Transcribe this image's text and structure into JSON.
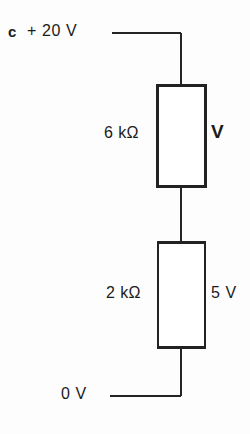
{
  "diagram": {
    "type": "electrical-circuit-schematic",
    "stroke_color": "#222222",
    "background_color": "#fdfdfd",
    "nodes": {
      "top_node_marker": "c",
      "supply_voltage": "+ 20 V",
      "ground_voltage": "0 V"
    },
    "components": [
      {
        "name": "resistor-upper",
        "value_label": "6 kΩ",
        "voltage_label": "V",
        "voltage_label_bold": true
      },
      {
        "name": "resistor-lower",
        "value_label": "2 kΩ",
        "voltage_label": "5 V",
        "voltage_label_bold": false
      }
    ],
    "geometry": {
      "wire_x": 181,
      "top_wire_y": 32,
      "top_wire_left_x": 112,
      "bottom_wire_y": 395,
      "bottom_wire_left_x": 110,
      "r1_box": {
        "x": 157,
        "y": 85,
        "w": 49,
        "h": 102
      },
      "r2_box": {
        "x": 158,
        "y": 242,
        "w": 47,
        "h": 106
      }
    }
  }
}
